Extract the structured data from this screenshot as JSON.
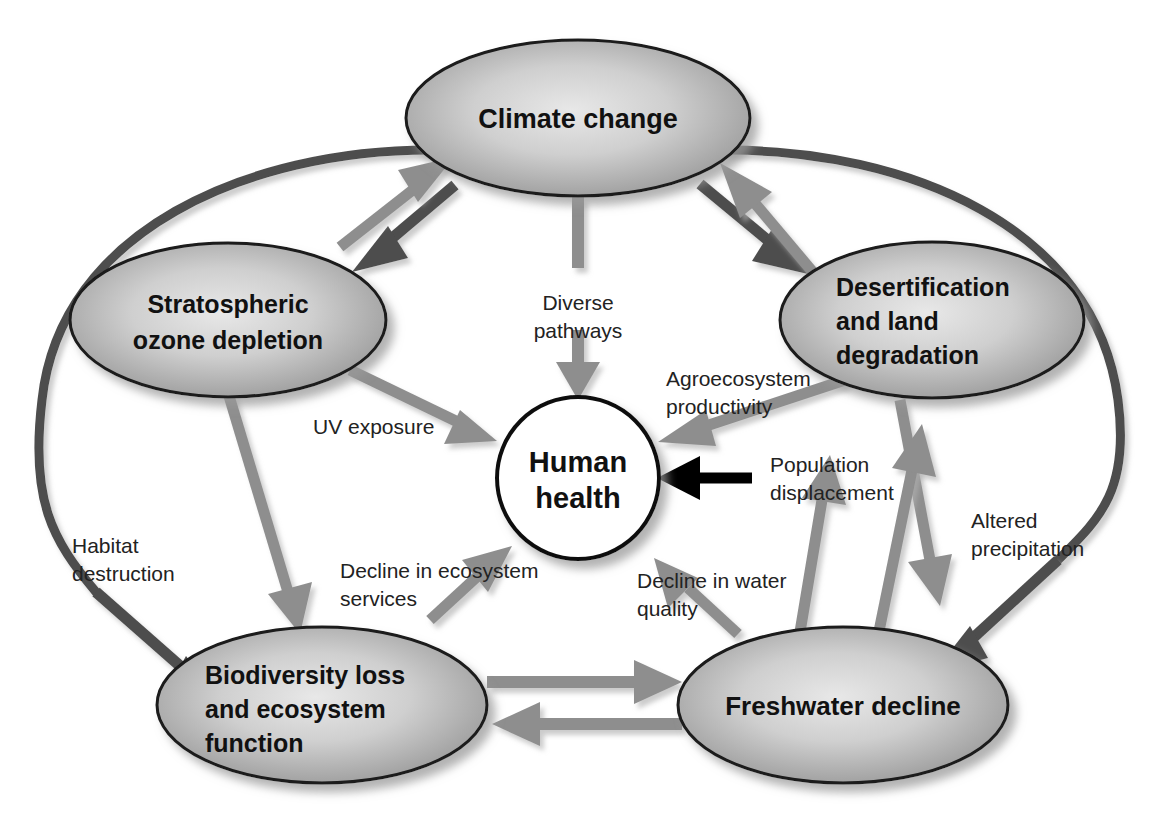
{
  "diagram": {
    "background_color": "#ffffff",
    "colors": {
      "node_fill_light": "#d9d9d9",
      "node_fill_dark": "#8a8a8a",
      "node_stroke": "#1a1a1a",
      "arrow_gray": "#8e8e8e",
      "arrow_dark": "#4d4d4d",
      "arrow_black": "#000000",
      "center_fill": "#ffffff",
      "text_color": "#111111",
      "outer_curve": "#4d4d4d"
    },
    "nodes": [
      {
        "id": "climate-change",
        "label_lines": [
          "Climate change"
        ],
        "shape": "ellipse",
        "cx": 578,
        "cy": 118,
        "rx": 172,
        "ry": 78,
        "fill": "gradient-gray",
        "font_size": 27
      },
      {
        "id": "stratospheric-ozone-depletion",
        "label_lines": [
          "Stratospheric",
          "ozone depletion"
        ],
        "shape": "ellipse",
        "cx": 228,
        "cy": 320,
        "rx": 158,
        "ry": 77,
        "fill": "gradient-gray",
        "font_size": 25
      },
      {
        "id": "desertification-and-land-degradation",
        "label_lines": [
          "Desertification",
          "and land",
          "degradation"
        ],
        "shape": "ellipse",
        "cx": 932,
        "cy": 320,
        "rx": 152,
        "ry": 78,
        "fill": "gradient-gray",
        "font_size": 25,
        "text_anchor": "start"
      },
      {
        "id": "human-health",
        "label_lines": [
          "Human",
          "health"
        ],
        "shape": "circle",
        "cx": 578,
        "cy": 478,
        "rx": 81,
        "ry": 81,
        "fill": "#ffffff",
        "font_size": 28
      },
      {
        "id": "biodiversity-loss-and-ecosystem-function",
        "label_lines": [
          "Biodiversity loss",
          "and ecosystem",
          "function"
        ],
        "shape": "ellipse",
        "cx": 322,
        "cy": 705,
        "rx": 165,
        "ry": 78,
        "fill": "gradient-gray",
        "font_size": 25,
        "text_anchor": "start"
      },
      {
        "id": "freshwater-decline",
        "label_lines": [
          "Freshwater decline"
        ],
        "shape": "ellipse",
        "cx": 843,
        "cy": 705,
        "rx": 165,
        "ry": 78,
        "fill": "gradient-gray",
        "font_size": 26
      }
    ],
    "edges": [
      {
        "id": "climate-to-human-health",
        "from": "climate-change",
        "to": "human-health",
        "label_lines": [
          "Diverse",
          "pathways"
        ],
        "label_x": 578,
        "label_y": 310,
        "label_anchor": "middle",
        "color": "arrow_gray",
        "direction": "down"
      },
      {
        "id": "ozone-to-human-health",
        "from": "stratospheric-ozone-depletion",
        "to": "human-health",
        "label_lines": [
          "UV exposure"
        ],
        "label_x": 313,
        "label_y": 434,
        "label_anchor": "start",
        "color": "arrow_gray",
        "direction": "down-right"
      },
      {
        "id": "desertification-to-human-health",
        "from": "desertification-and-land-degradation",
        "to": "human-health",
        "label_lines": [
          "Agroecosystem",
          "productivity"
        ],
        "label_x": 666,
        "label_y": 386,
        "label_anchor": "start",
        "color": "arrow_gray",
        "direction": "down-left"
      },
      {
        "id": "population-displacement-to-human-health",
        "from": "freshwater-decline",
        "to": "human-health",
        "label_lines": [
          "Population",
          "displacement"
        ],
        "label_x": 770,
        "label_y": 472,
        "label_anchor": "start",
        "color": "arrow_black",
        "direction": "left"
      },
      {
        "id": "biodiversity-to-human-health",
        "from": "biodiversity-loss-and-ecosystem-function",
        "to": "human-health",
        "label_lines": [
          "Decline in ecosystem",
          "services"
        ],
        "label_x": 340,
        "label_y": 578,
        "label_anchor": "start",
        "color": "arrow_gray",
        "direction": "up-right"
      },
      {
        "id": "freshwater-to-human-health",
        "from": "freshwater-decline",
        "to": "human-health",
        "label_lines": [
          "Decline in water",
          "quality"
        ],
        "label_x": 637,
        "label_y": 588,
        "label_anchor": "start",
        "color": "arrow_gray",
        "direction": "up-left"
      },
      {
        "id": "climate-to-biodiversity-habitat-destruction",
        "from": "climate-change",
        "to": "biodiversity-loss-and-ecosystem-function",
        "label_lines": [
          "Habitat",
          "destruction"
        ],
        "label_x": 72,
        "label_y": 553,
        "label_anchor": "start",
        "color": "arrow_dark",
        "direction": "down-right"
      },
      {
        "id": "climate-to-freshwater-altered-precipitation",
        "from": "climate-change",
        "to": "freshwater-decline",
        "label_lines": [
          "Altered",
          "precipitation"
        ],
        "label_x": 971,
        "label_y": 528,
        "label_anchor": "start",
        "color": "arrow_dark",
        "direction": "down-left"
      },
      {
        "id": "climate-to-ozone",
        "from": "climate-change",
        "to": "stratospheric-ozone-depletion",
        "label_lines": [],
        "color": "arrow_dark",
        "direction": "down-left"
      },
      {
        "id": "ozone-to-climate",
        "from": "stratospheric-ozone-depletion",
        "to": "climate-change",
        "label_lines": [],
        "color": "arrow_gray",
        "direction": "up-right"
      },
      {
        "id": "climate-to-desertification",
        "from": "climate-change",
        "to": "desertification-and-land-degradation",
        "label_lines": [],
        "color": "arrow_dark",
        "direction": "down-right"
      },
      {
        "id": "desertification-to-climate",
        "from": "desertification-and-land-degradation",
        "to": "climate-change",
        "label_lines": [],
        "color": "arrow_gray",
        "direction": "up-left"
      },
      {
        "id": "ozone-to-biodiversity",
        "from": "stratospheric-ozone-depletion",
        "to": "biodiversity-loss-and-ecosystem-function",
        "label_lines": [],
        "color": "arrow_gray",
        "direction": "down"
      },
      {
        "id": "biodiversity-to-freshwater",
        "from": "biodiversity-loss-and-ecosystem-function",
        "to": "freshwater-decline",
        "label_lines": [],
        "color": "arrow_gray",
        "direction": "right"
      },
      {
        "id": "freshwater-to-biodiversity",
        "from": "freshwater-decline",
        "to": "biodiversity-loss-and-ecosystem-function",
        "label_lines": [],
        "color": "arrow_gray",
        "direction": "left"
      },
      {
        "id": "freshwater-to-desertification",
        "from": "freshwater-decline",
        "to": "desertification-and-land-degradation",
        "label_lines": [],
        "color": "arrow_gray",
        "direction": "up-right"
      },
      {
        "id": "desertification-to-freshwater",
        "from": "desertification-and-land-degradation",
        "to": "freshwater-decline",
        "label_lines": [],
        "color": "arrow_gray",
        "direction": "down-left"
      }
    ]
  }
}
